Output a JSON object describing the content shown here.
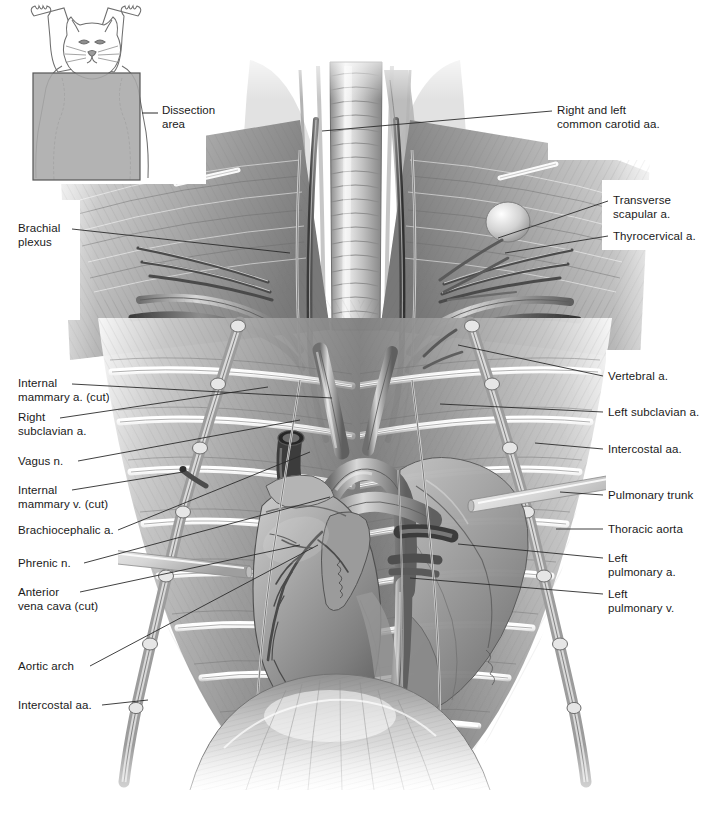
{
  "figure": {
    "kind": "anatomical-illustration",
    "style": "grayscale airbrush medical illustration",
    "width": 710,
    "height": 823,
    "background_color": "#ffffff",
    "line_color": "#2b2b2b",
    "text_color": "#1a1a1a"
  },
  "inset": {
    "name": "orientation-inset",
    "description": "Small line drawing of a cat in dorsal recumbency, forelimbs raised, with a shaded rectangle over the ventral thorax",
    "caption": "Dissection\narea",
    "box_fill": "#a9a9a9",
    "box_stroke": "#555555",
    "outline_color": "#6e6e6e",
    "box": {
      "x": 33,
      "y": 73,
      "w": 107,
      "h": 107
    },
    "caption_pos": {
      "x": 162,
      "y": 112
    }
  },
  "labels_left": [
    {
      "id": "brachial-plexus",
      "text": "Brachial\nplexus",
      "x": 18,
      "y": 222,
      "leader": {
        "x1": 72,
        "y1": 229,
        "x2": 290,
        "y2": 253
      }
    },
    {
      "id": "internal-mammary-a-cut",
      "text": "Internal\nmammary a. (cut)",
      "x": 18,
      "y": 377,
      "leader": {
        "x1": 72,
        "y1": 384,
        "x2": 332,
        "y2": 398
      }
    },
    {
      "id": "right-subclavian-a",
      "text": "Right\nsubclavian a.",
      "x": 18,
      "y": 411,
      "leader": {
        "x1": 60,
        "y1": 418,
        "x2": 268,
        "y2": 387
      }
    },
    {
      "id": "vagus-n",
      "text": "Vagus n.",
      "x": 18,
      "y": 455,
      "leader": {
        "x1": 78,
        "y1": 461,
        "x2": 300,
        "y2": 420
      }
    },
    {
      "id": "internal-mammary-v-cut",
      "text": "Internal\nmammary v. (cut)",
      "x": 18,
      "y": 484,
      "leader": {
        "x1": 72,
        "y1": 490,
        "x2": 183,
        "y2": 472
      }
    },
    {
      "id": "brachiocephalic-a",
      "text": "Brachiocephalic a.",
      "x": 18,
      "y": 524,
      "leader": {
        "x1": 118,
        "y1": 530,
        "x2": 310,
        "y2": 452
      }
    },
    {
      "id": "phrenic-n",
      "text": "Phrenic n.",
      "x": 18,
      "y": 557,
      "leader": {
        "x1": 84,
        "y1": 563,
        "x2": 330,
        "y2": 497
      }
    },
    {
      "id": "anterior-vena-cava-cut",
      "text": "Anterior\nvena cava (cut)",
      "x": 18,
      "y": 586,
      "leader": {
        "x1": 80,
        "y1": 592,
        "x2": 300,
        "y2": 545
      }
    },
    {
      "id": "aortic-arch",
      "text": "Aortic arch",
      "x": 18,
      "y": 660,
      "leader": {
        "x1": 90,
        "y1": 666,
        "x2": 318,
        "y2": 545
      }
    },
    {
      "id": "intercostal-aa-left",
      "text": "Intercostal aa.",
      "x": 18,
      "y": 699,
      "leader": {
        "x1": 102,
        "y1": 705,
        "x2": 148,
        "y2": 700
      }
    }
  ],
  "labels_right": [
    {
      "id": "common-carotid-aa",
      "text": "Right and left\ncommon carotid aa.",
      "x": 557,
      "y": 104,
      "leader": {
        "x1": 552,
        "y1": 111,
        "x2": 322,
        "y2": 131
      }
    },
    {
      "id": "transverse-scapular-a",
      "text": "Transverse\nscapular a.",
      "x": 613,
      "y": 194,
      "leader": {
        "x1": 608,
        "y1": 201,
        "x2": 498,
        "y2": 238
      }
    },
    {
      "id": "thyrocervical-a",
      "text": "Thyrocervical a.",
      "x": 613,
      "y": 230,
      "leader": {
        "x1": 608,
        "y1": 236,
        "x2": 505,
        "y2": 253
      }
    },
    {
      "id": "vertebral-a",
      "text": "Vertebral a.",
      "x": 608,
      "y": 370,
      "leader": {
        "x1": 603,
        "y1": 376,
        "x2": 458,
        "y2": 345
      }
    },
    {
      "id": "left-subclavian-a",
      "text": "Left subclavian a.",
      "x": 608,
      "y": 406,
      "leader": {
        "x1": 603,
        "y1": 412,
        "x2": 440,
        "y2": 404
      }
    },
    {
      "id": "intercostal-aa-right",
      "text": "Intercostal aa.",
      "x": 608,
      "y": 443,
      "leader": {
        "x1": 603,
        "y1": 449,
        "x2": 535,
        "y2": 443
      }
    },
    {
      "id": "pulmonary-trunk",
      "text": "Pulmonary trunk",
      "x": 608,
      "y": 489,
      "leader": {
        "x1": 603,
        "y1": 495,
        "x2": 560,
        "y2": 492
      }
    },
    {
      "id": "thoracic-aorta",
      "text": "Thoracic aorta",
      "x": 608,
      "y": 523,
      "leader": {
        "x1": 603,
        "y1": 529,
        "x2": 556,
        "y2": 529
      }
    },
    {
      "id": "left-pulmonary-a",
      "text": "Left\npulmonary a.",
      "x": 608,
      "y": 552,
      "leader": {
        "x1": 603,
        "y1": 558,
        "x2": 458,
        "y2": 544
      }
    },
    {
      "id": "left-pulmonary-v",
      "text": "Left\npulmonary v.",
      "x": 608,
      "y": 588,
      "leader": {
        "x1": 603,
        "y1": 594,
        "x2": 410,
        "y2": 578
      }
    }
  ]
}
